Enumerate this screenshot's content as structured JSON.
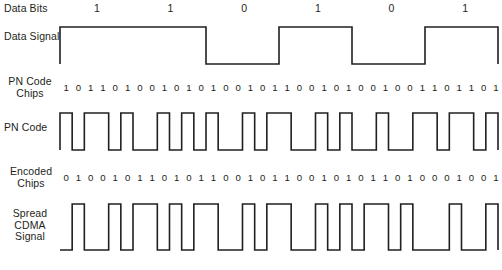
{
  "figure": {
    "line_color": "#231f20",
    "background_color": "#ffffff",
    "chips_per_bit": 6,
    "total_chips": 36
  },
  "rows": {
    "data_bits": {
      "label": "Data Bits",
      "values": [
        "1",
        "1",
        "0",
        "1",
        "0",
        "1"
      ]
    },
    "data_signal": {
      "label": "Data Signal",
      "levels": [
        1,
        1,
        0,
        1,
        0,
        1
      ]
    },
    "pn_code_chips": {
      "label": "PN Code\nChips",
      "values": [
        "1",
        "0",
        "1",
        "1",
        "0",
        "1",
        "0",
        "0",
        "1",
        "0",
        "1",
        "0",
        "1",
        "0",
        "0",
        "1",
        "0",
        "1",
        "1",
        "0",
        "0",
        "1",
        "0",
        "1",
        "0",
        "0",
        "1",
        "0",
        "0",
        "1",
        "1",
        "0",
        "1",
        "1",
        "0",
        "1"
      ]
    },
    "pn_code": {
      "label": "PN Code",
      "levels": [
        1,
        0,
        1,
        1,
        0,
        1,
        0,
        0,
        1,
        0,
        1,
        0,
        1,
        0,
        0,
        1,
        0,
        1,
        1,
        0,
        0,
        1,
        0,
        1,
        0,
        0,
        1,
        0,
        0,
        1,
        1,
        0,
        1,
        1,
        0,
        1
      ]
    },
    "encoded_chips": {
      "label": "Encoded\nChips",
      "values": [
        "0",
        "1",
        "0",
        "0",
        "1",
        "0",
        "1",
        "1",
        "0",
        "1",
        "0",
        "1",
        "1",
        "0",
        "0",
        "1",
        "0",
        "1",
        "1",
        "0",
        "0",
        "1",
        "0",
        "1",
        "0",
        "1",
        "1",
        "0",
        "1",
        "0",
        "0",
        "0",
        "1",
        "0",
        "0",
        "1"
      ]
    },
    "spread_cdma_signal": {
      "label": "Spread\nCDMA\nSignal",
      "levels": [
        0,
        1,
        0,
        0,
        1,
        0,
        1,
        1,
        0,
        1,
        0,
        1,
        1,
        0,
        0,
        1,
        0,
        1,
        1,
        0,
        0,
        1,
        0,
        1,
        0,
        1,
        1,
        0,
        1,
        0,
        0,
        0,
        1,
        0,
        0,
        1
      ]
    }
  },
  "chart_data": {
    "type": "line",
    "xlabel": "",
    "ylabel": "",
    "ylim": [
      0,
      1
    ],
    "grid": false,
    "legend": "none",
    "x": [
      0,
      1,
      2,
      3,
      4,
      5,
      6,
      7,
      8,
      9,
      10,
      11,
      12,
      13,
      14,
      15,
      16,
      17,
      18,
      19,
      20,
      21,
      22,
      23,
      24,
      25,
      26,
      27,
      28,
      29,
      30,
      31,
      32,
      33,
      34,
      35
    ],
    "series": [
      {
        "name": "Data Signal",
        "values": [
          1,
          1,
          1,
          1,
          1,
          1,
          1,
          1,
          1,
          1,
          1,
          1,
          0,
          0,
          0,
          0,
          0,
          0,
          1,
          1,
          1,
          1,
          1,
          1,
          0,
          0,
          0,
          0,
          0,
          0,
          1,
          1,
          1,
          1,
          1,
          1
        ]
      },
      {
        "name": "PN Code",
        "values": [
          1,
          0,
          1,
          1,
          0,
          1,
          0,
          0,
          1,
          0,
          1,
          0,
          1,
          0,
          0,
          1,
          0,
          1,
          1,
          0,
          0,
          1,
          0,
          1,
          0,
          0,
          1,
          0,
          0,
          1,
          1,
          0,
          1,
          1,
          0,
          1
        ]
      },
      {
        "name": "Spread CDMA Signal",
        "values": [
          0,
          1,
          0,
          0,
          1,
          0,
          1,
          1,
          0,
          1,
          0,
          1,
          1,
          0,
          0,
          1,
          0,
          1,
          1,
          0,
          0,
          1,
          0,
          1,
          0,
          1,
          1,
          0,
          1,
          0,
          0,
          0,
          1,
          0,
          0,
          1
        ]
      }
    ]
  }
}
